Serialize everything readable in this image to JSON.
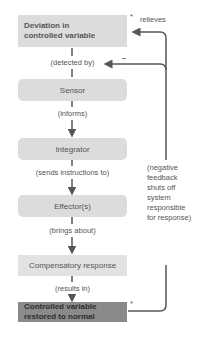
{
  "diagram": {
    "nodes": [
      {
        "id": "deviation",
        "label_line1": "Deviation in",
        "label_line2": "controlled variable"
      },
      {
        "id": "sensor",
        "label": "Sensor"
      },
      {
        "id": "integrator",
        "label": "Integrator"
      },
      {
        "id": "effector",
        "label": "Effector(s)"
      },
      {
        "id": "compensatory",
        "label": "Compensatory response"
      },
      {
        "id": "restored",
        "label_line1": "Controlled variable",
        "label_line2": "restored to normal"
      }
    ],
    "edges": [
      {
        "label": "(detected by)"
      },
      {
        "label": "(informs)"
      },
      {
        "label": "(sends instructions to)"
      },
      {
        "label": "(brings about)"
      },
      {
        "label": "(results in)"
      }
    ],
    "feedback": {
      "relieves_label": "relieves",
      "asterisk_top": "*",
      "asterisk_bottom": "*",
      "minus_sign": "–",
      "note_lines": [
        "(negative",
        "feedback",
        "shuts off",
        "system",
        "responsible",
        "for response)"
      ]
    },
    "colors": {
      "box_light": "#dcdcdc",
      "box_dark": "#8a8a8a",
      "arrow": "#555555"
    }
  }
}
